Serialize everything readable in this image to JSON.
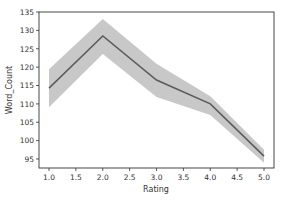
{
  "chart_data": {
    "type": "line",
    "title": "",
    "xlabel": "Rating",
    "ylabel": "Word_Count",
    "x": [
      1.0,
      2.0,
      3.0,
      4.0,
      5.0
    ],
    "series": [
      {
        "name": "Word_Count",
        "values": [
          114.3,
          128.5,
          116.5,
          110.0,
          95.8
        ],
        "ci_lower": [
          109.1,
          123.6,
          111.9,
          107.0,
          94.0
        ],
        "ci_upper": [
          119.4,
          133.1,
          120.9,
          112.1,
          97.5
        ],
        "color": "#5a5a5a",
        "ci_color": "#c8c8c8"
      }
    ],
    "xlim": [
      0.8,
      5.19
    ],
    "ylim": [
      92.5,
      135.0
    ],
    "xticks": [
      "1.0",
      "1.5",
      "2.0",
      "2.5",
      "3.0",
      "3.5",
      "4.0",
      "4.5",
      "5.0"
    ],
    "yticks": [
      "95",
      "100",
      "105",
      "110",
      "115",
      "120",
      "125",
      "130",
      "135"
    ],
    "grid": false,
    "legend": null
  }
}
